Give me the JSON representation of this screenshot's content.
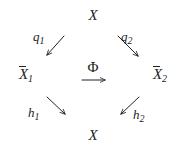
{
  "figure": {
    "type": "commutative-diagram",
    "background_color": "#ffffff",
    "ink_color": "#232323"
  },
  "nodes": {
    "top": {
      "label": "X",
      "overline": false,
      "subscript": ""
    },
    "bottom": {
      "label": "X",
      "overline": false,
      "subscript": ""
    },
    "left": {
      "label": "X",
      "overline": true,
      "subscript": "1"
    },
    "right": {
      "label": "X",
      "overline": true,
      "subscript": "2"
    },
    "center": {
      "label": "Φ"
    }
  },
  "node_text": {
    "top": "X",
    "bottom": "X",
    "left_base": "X",
    "left_sub": "1",
    "right_base": "X",
    "right_sub": "2",
    "center": "Φ"
  },
  "arrows": [
    {
      "name": "q1",
      "label_base": "q",
      "label_sub": "1",
      "label": "q₁",
      "from": "X (top)",
      "to": "X̅1 (left)",
      "direction": "down-left",
      "x1": 64,
      "y1": 36,
      "x2": 47,
      "y2": 55
    },
    {
      "name": "q2",
      "label_base": "q",
      "label_sub": "2",
      "label": "q₂",
      "from": "X (top)",
      "to": "X̅2 (right)",
      "direction": "down-right",
      "x1": 118,
      "y1": 36,
      "x2": 138,
      "y2": 56
    },
    {
      "name": "phi",
      "label_base": "Φ",
      "label_sub": "",
      "label": "Φ",
      "from": "X̅1 (left)",
      "to": "X̅2 (right)",
      "direction": "right",
      "x1": 82,
      "y1": 80,
      "x2": 105,
      "y2": 80
    },
    {
      "name": "h1",
      "label_base": "h",
      "label_sub": "1",
      "label": "h₁",
      "from": "X̅1 (left)",
      "to": "X (bottom)",
      "direction": "down-right",
      "x1": 47,
      "y1": 97,
      "x2": 65,
      "y2": 114
    },
    {
      "name": "h2",
      "label_base": "h",
      "label_sub": "2",
      "label": "h₂",
      "from": "X̅2 (right)",
      "to": "X (bottom)",
      "direction": "down-left",
      "x1": 139,
      "y1": 97,
      "x2": 121,
      "y2": 114
    }
  ],
  "labels": {
    "q1_base": "q",
    "q1_sub": "1",
    "q2_base": "q",
    "q2_sub": "2",
    "h1_base": "h",
    "h1_sub": "1",
    "h2_base": "h",
    "h2_sub": "2"
  }
}
